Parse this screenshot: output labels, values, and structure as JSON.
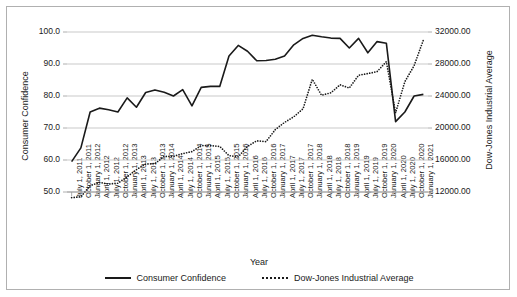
{
  "chart_data": {
    "type": "line",
    "title": "",
    "xlabel": "Year",
    "ylabel": "Consumer Confidence",
    "y2label": "Dow-Jones Industrial Average",
    "grid": true,
    "legend_position": "bottom",
    "ylim": [
      50.0,
      100.0
    ],
    "y2lim": [
      12000.0,
      32000.0
    ],
    "yticks": [
      "50.0",
      "60.0",
      "70.0",
      "80.0",
      "90.0",
      "100.0"
    ],
    "ytick_values": [
      50.0,
      60.0,
      70.0,
      80.0,
      90.0,
      100.0
    ],
    "y2ticks": [
      "12000.00",
      "16000.00",
      "20000.00",
      "24000.00",
      "28000.00",
      "32000.00"
    ],
    "y2tick_values": [
      12000,
      16000,
      20000,
      24000,
      28000,
      32000
    ],
    "categories": [
      "July 1, 2011",
      "October 1, 2011",
      "January 1, 2012",
      "April 1, 2012",
      "July 1, 2012",
      "October 1, 2012",
      "January 1, 2013",
      "April 1, 2013",
      "July 1, 2013",
      "October 1, 2013",
      "January 1, 2014",
      "April 1, 2014",
      "July 1, 2014",
      "October 1, 2014",
      "January 1, 2015",
      "April 1, 2015",
      "July 1, 2015",
      "October 1, 2015",
      "January 1, 2016",
      "April 1, 2016",
      "July 1, 2016",
      "October 1, 2016",
      "January 1, 2017",
      "April 1, 2017",
      "July 1, 2017",
      "October 1, 2017",
      "January 1, 2018",
      "April 1, 2018",
      "July 1, 2018",
      "October 1, 2018",
      "January 1, 2019",
      "April 1, 2019",
      "July 1, 2019",
      "October 1, 2019",
      "January 1, 2020",
      "April 1, 2020",
      "July 1, 2020",
      "October 1, 2020",
      "January 1, 2021"
    ],
    "series": [
      {
        "name": "Consumer Confidence",
        "axis": "left",
        "style": "solid",
        "color": "#1a1a1a",
        "values": [
          59.5,
          63.8,
          75.0,
          76.2,
          75.7,
          75.0,
          79.4,
          76.5,
          81.1,
          81.9,
          81.2,
          80.0,
          82.0,
          76.9,
          82.7,
          83.0,
          83.0,
          92.5,
          95.8,
          94.0,
          91.0,
          91.1,
          91.5,
          92.5,
          96.0,
          98.0,
          99.0,
          98.5,
          98.1,
          98.0,
          95.0,
          98.0,
          93.5,
          97.0,
          96.5,
          72.0,
          75.0,
          80.0,
          80.5
        ]
      },
      {
        "name": "Dow-Jones Industrial Average",
        "axis": "right",
        "style": "dotted",
        "color": "#1a1a1a",
        "values": [
          11300,
          11400,
          12800,
          13200,
          13000,
          13100,
          13900,
          14800,
          15500,
          15550,
          16450,
          16450,
          16800,
          17050,
          17800,
          17800,
          17700,
          16550,
          16400,
          17700,
          18400,
          18300,
          19800,
          20700,
          21400,
          22400,
          26100,
          24100,
          24400,
          25400,
          25000,
          26600,
          26800,
          27050,
          28300,
          21900,
          25800,
          27800,
          31000
        ]
      }
    ]
  },
  "legend": {
    "items": [
      {
        "label": "Consumer Confidence",
        "style": "solid"
      },
      {
        "label": "Dow-Jones Industrial Average",
        "style": "dotted"
      }
    ]
  }
}
